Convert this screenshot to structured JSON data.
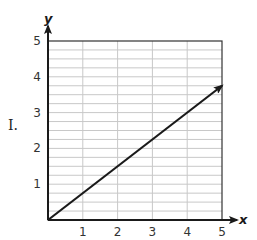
{
  "label": "I.",
  "chart_data": {
    "type": "line",
    "title": "",
    "xlabel": "x",
    "ylabel": "y",
    "xlim": [
      0,
      5
    ],
    "ylim": [
      0,
      5
    ],
    "x_ticks": [
      "1",
      "2",
      "3",
      "4",
      "5"
    ],
    "y_ticks": [
      "1",
      "2",
      "3",
      "4",
      "5"
    ],
    "grid": {
      "vertical_step": 1,
      "horizontal_step": 0.25
    },
    "series": [
      {
        "name": "line",
        "x": [
          0,
          5
        ],
        "y": [
          0,
          3.75
        ],
        "arrow_end": true,
        "color": "#1a1a1a"
      }
    ]
  },
  "colors": {
    "axis": "#1a1a1a",
    "grid": "#c8c8c8",
    "border": "#333333",
    "line": "#1a1a1a"
  }
}
